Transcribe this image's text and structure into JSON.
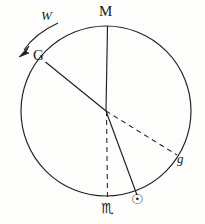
{
  "figure": {
    "background_color": "#fdfdfc",
    "ink_color": "#1a1a1a",
    "width": 205,
    "height": 224,
    "circle": {
      "cx": 106,
      "cy": 111,
      "r": 85
    },
    "labels": {
      "meridian": "M",
      "ascendant": "G",
      "rotation": "W",
      "descendant": "g",
      "scorpio": "♏",
      "sun": "☉"
    },
    "label_names": {
      "meridian": "point-label-M",
      "ascendant": "point-label-G",
      "rotation": "rotation-label-W",
      "descendant": "point-label-g",
      "scorpio": "scorpio-symbol",
      "sun": "sun-symbol"
    },
    "radii": [
      {
        "name": "radius-to-M",
        "style": "solid",
        "to": "M"
      },
      {
        "name": "radius-to-G",
        "style": "solid",
        "to": "G"
      },
      {
        "name": "radius-to-g",
        "style": "dashed",
        "to": "g"
      },
      {
        "name": "radius-to-scorpio",
        "style": "dashed",
        "to": "♏"
      },
      {
        "name": "radius-to-sun",
        "style": "solid",
        "to": "☉"
      }
    ],
    "arrow": {
      "name": "rotation-arrow",
      "direction": "counterclockwise"
    }
  }
}
